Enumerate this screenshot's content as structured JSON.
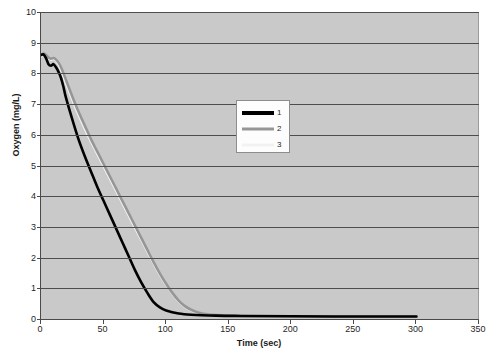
{
  "chart_data": {
    "type": "line",
    "title": "",
    "xlabel": "Time (sec)",
    "ylabel": "Oxygen (mg/L)",
    "xlim": [
      0,
      350
    ],
    "ylim": [
      0,
      10
    ],
    "xticks": [
      0,
      50,
      100,
      150,
      200,
      250,
      300,
      350
    ],
    "yticks": [
      0,
      1,
      2,
      3,
      4,
      5,
      6,
      7,
      8,
      9,
      10
    ],
    "grid": "horizontal",
    "legend_position": "center",
    "plot_background": "#c9c9c9",
    "gridline_color": "#4d4d4d",
    "series": [
      {
        "name": "1",
        "color": "#000000",
        "width": 2.6,
        "x": [
          0,
          2,
          4,
          6,
          8,
          10,
          12,
          14,
          16,
          18,
          20,
          25,
          30,
          35,
          40,
          45,
          50,
          55,
          60,
          65,
          70,
          75,
          80,
          85,
          90,
          95,
          100,
          110,
          120,
          140,
          160,
          200,
          250,
          300
        ],
        "y": [
          8.6,
          8.62,
          8.5,
          8.3,
          8.25,
          8.3,
          8.2,
          8.05,
          7.85,
          7.55,
          7.2,
          6.5,
          5.85,
          5.3,
          4.8,
          4.3,
          3.85,
          3.4,
          2.95,
          2.5,
          2.05,
          1.6,
          1.2,
          0.85,
          0.55,
          0.38,
          0.28,
          0.18,
          0.14,
          0.11,
          0.1,
          0.09,
          0.08,
          0.08
        ]
      },
      {
        "name": "2",
        "color": "#969696",
        "width": 2.6,
        "x": [
          0,
          2,
          4,
          6,
          8,
          10,
          12,
          14,
          16,
          18,
          20,
          25,
          30,
          35,
          40,
          45,
          50,
          55,
          60,
          65,
          70,
          75,
          80,
          85,
          90,
          95,
          100,
          105,
          110,
          115,
          120,
          125,
          130,
          140,
          160,
          200,
          250,
          300
        ],
        "y": [
          8.6,
          8.65,
          8.6,
          8.52,
          8.48,
          8.5,
          8.45,
          8.35,
          8.2,
          8.0,
          7.78,
          7.25,
          6.75,
          6.3,
          5.85,
          5.45,
          5.05,
          4.65,
          4.25,
          3.85,
          3.45,
          3.05,
          2.65,
          2.25,
          1.85,
          1.48,
          1.15,
          0.85,
          0.6,
          0.42,
          0.3,
          0.22,
          0.17,
          0.13,
          0.1,
          0.09,
          0.08,
          0.08
        ]
      },
      {
        "name": "3",
        "color": "#f2f2f2",
        "width": 2.6,
        "x": [
          0,
          2,
          4,
          6,
          8,
          10,
          12,
          14,
          16,
          18,
          20,
          25,
          30,
          35,
          40,
          45,
          50,
          55,
          60,
          65,
          70,
          75,
          80,
          85,
          90,
          95,
          100,
          105,
          110,
          115,
          120,
          125,
          130,
          140,
          160,
          200,
          250,
          300
        ],
        "y": [
          8.55,
          8.62,
          8.58,
          8.5,
          8.45,
          8.48,
          8.42,
          8.3,
          8.12,
          7.9,
          7.68,
          7.15,
          6.65,
          6.2,
          5.78,
          5.38,
          4.98,
          4.58,
          4.18,
          3.78,
          3.38,
          2.98,
          2.6,
          2.2,
          1.82,
          1.45,
          1.12,
          0.83,
          0.58,
          0.4,
          0.28,
          0.2,
          0.15,
          0.12,
          0.1,
          0.09,
          0.08,
          0.08
        ]
      }
    ]
  },
  "legend": {
    "items": [
      {
        "label": "1"
      },
      {
        "label": "2"
      },
      {
        "label": "3"
      }
    ]
  },
  "caption": ""
}
